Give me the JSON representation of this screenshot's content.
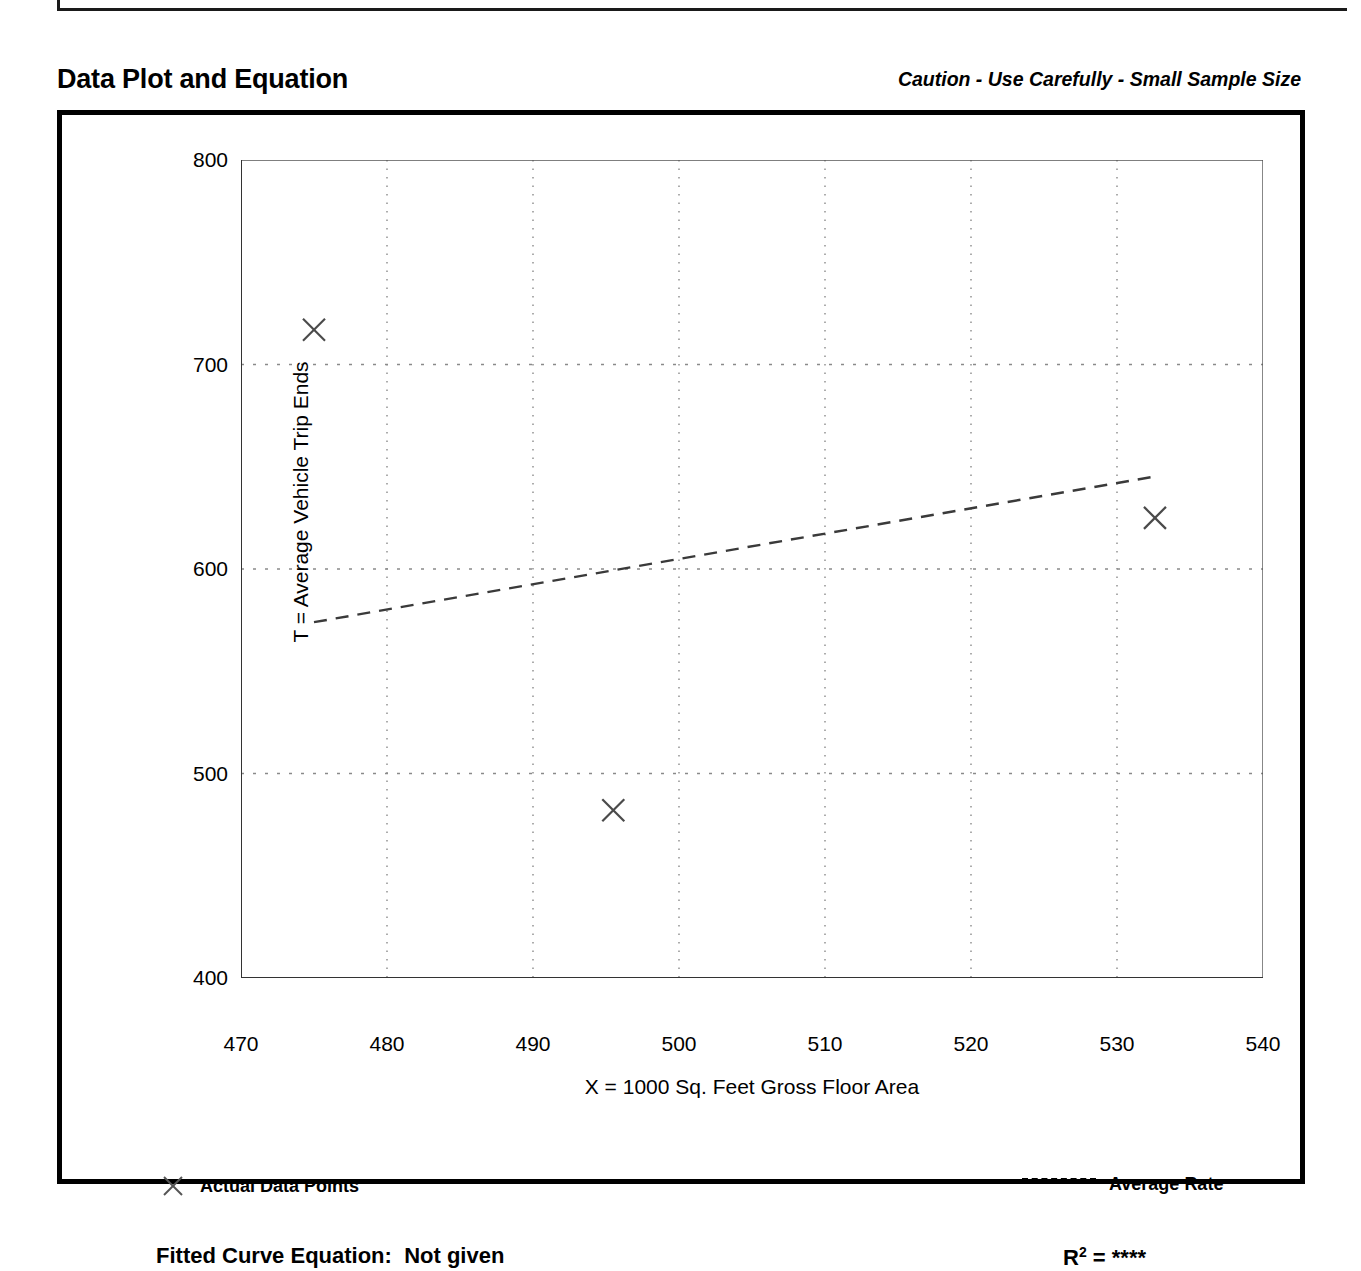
{
  "header": {
    "title": "Data Plot and Equation",
    "caution": "Caution - Use Carefully - Small Sample Size"
  },
  "footer": {
    "fitted_equation_label": "Fitted Curve Equation:",
    "fitted_equation_value": "Not given",
    "r_squared_label": "R",
    "r_squared_exponent": "2",
    "r_squared_value": "= ****"
  },
  "legend": {
    "data_points_label": "Actual Data Points",
    "data_points_marker": "x-marker-icon",
    "average_rate_label": "Average Rate",
    "average_rate_marker": "dashed-line-icon"
  },
  "chart_data": {
    "type": "scatter",
    "title": "Data Plot and Equation",
    "subtitle": "Caution - Use Carefully - Small Sample Size",
    "xlabel": "X = 1000 Sq. Feet Gross Floor Area",
    "ylabel": "T = Average Vehicle Trip Ends",
    "xlim": [
      470,
      540
    ],
    "ylim": [
      400,
      800
    ],
    "xticks": [
      470,
      480,
      490,
      500,
      510,
      520,
      530,
      540
    ],
    "yticks": [
      400,
      500,
      600,
      700,
      800
    ],
    "x_minor_tick_interval": 5,
    "y_minor_tick_interval": 50,
    "grid": true,
    "grid_style": "dotted",
    "legend_position": "below-plot",
    "series": [
      {
        "name": "Actual Data Points",
        "type": "scatter",
        "marker": "x",
        "points": [
          {
            "x": 475.0,
            "y": 717
          },
          {
            "x": 495.5,
            "y": 482
          },
          {
            "x": 532.6,
            "y": 625
          }
        ]
      },
      {
        "name": "Average Rate",
        "type": "line",
        "style": "dashed",
        "points": [
          {
            "x": 475.0,
            "y": 574
          },
          {
            "x": 532.4,
            "y": 645
          }
        ]
      }
    ],
    "fitted_curve_equation": "Not given",
    "r_squared": "****"
  },
  "axes": {
    "y_tick_labels": [
      "800",
      "700",
      "600",
      "500",
      "400"
    ],
    "x_tick_labels": [
      "470",
      "480",
      "490",
      "500",
      "510",
      "520",
      "530",
      "540"
    ],
    "y_title": "T = Average Vehicle Trip Ends",
    "x_title": "X = 1000 Sq. Feet Gross Floor Area"
  },
  "colors": {
    "ink": "#000000",
    "grid": "#8a8a8a",
    "background": "#ffffff"
  }
}
